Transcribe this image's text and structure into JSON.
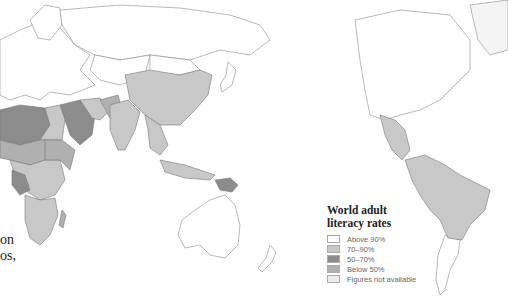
{
  "map": {
    "title_lines": [
      "World adult",
      "literacy rates"
    ],
    "legend": [
      {
        "label": "Above 90%",
        "color": "#ffffff"
      },
      {
        "label": "70–90%",
        "color": "#c8c8c8"
      },
      {
        "label": "50–70%",
        "color": "#8c8c8c"
      },
      {
        "label": "Below 50%",
        "color": "#b0b0b0"
      },
      {
        "label": "Figures not available",
        "color": "#ececec"
      }
    ],
    "colors": {
      "above_90": "#ffffff",
      "range_70_90": "#c8c8c8",
      "range_50_70": "#8c8c8c",
      "below_50": "#b0b0b0",
      "not_available": "#ececec",
      "border": "#777777",
      "ocean": "#ffffff"
    }
  },
  "side_text": {
    "line1": "on",
    "line2": "os,"
  }
}
